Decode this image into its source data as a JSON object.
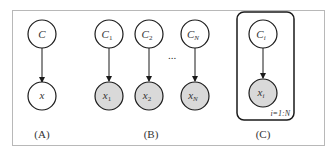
{
  "colors": {
    "background": "#ffffff",
    "frame": "#b8b8b8",
    "stroke": "#1a1a1a",
    "observed_fill": "#d9d9d9",
    "latent_fill": "#ffffff"
  },
  "panels": [
    {
      "label": "(A)",
      "nodes": [
        {
          "id": "C",
          "label": "C",
          "sub": "",
          "observed": false
        },
        {
          "id": "x",
          "label": "x",
          "sub": "",
          "observed": false
        }
      ]
    },
    {
      "label": "(B)",
      "nodes": [
        {
          "id": "C1",
          "label": "C",
          "sub": "1",
          "observed": false
        },
        {
          "id": "C2",
          "label": "C",
          "sub": "2",
          "observed": false
        },
        {
          "id": "CN",
          "label": "C",
          "sub": "N",
          "observed": false
        },
        {
          "id": "x1",
          "label": "x",
          "sub": "1",
          "observed": true
        },
        {
          "id": "x2",
          "label": "x",
          "sub": "2",
          "observed": true
        },
        {
          "id": "xN",
          "label": "x",
          "sub": "N",
          "observed": true
        }
      ],
      "ellipsis": "..."
    },
    {
      "label": "(C)",
      "nodes": [
        {
          "id": "Ci",
          "label": "C",
          "sub": "i",
          "observed": false
        },
        {
          "id": "xi",
          "label": "x",
          "sub": "i",
          "observed": true
        }
      ],
      "plate_label": "i=1:N"
    }
  ]
}
